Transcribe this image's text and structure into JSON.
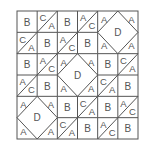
{
  "diagram": {
    "title": "",
    "grid": {
      "rows": 6,
      "cols": 6,
      "x0": 17,
      "y0": 11,
      "x1": 138,
      "y1": 139
    },
    "line_color": "#555555",
    "background": "#ffffff",
    "cells": [
      [
        "B",
        "C/A",
        "B",
        "A/C",
        "D",
        "D"
      ],
      [
        "C/A",
        "B",
        "A/C",
        "B",
        "D",
        "D"
      ],
      [
        "B",
        "A/C",
        "D",
        "D",
        "B",
        "C/A"
      ],
      [
        "A/C",
        "B",
        "D",
        "D",
        "C/A",
        "B"
      ],
      [
        "D",
        "D",
        "B",
        "C/A",
        "B",
        "A/C"
      ],
      [
        "D",
        "D",
        "C/A",
        "B",
        "A/C",
        "B"
      ]
    ],
    "d_blocks": [
      {
        "row": 0,
        "col": 4,
        "center_label": "D",
        "corner_label": "A"
      },
      {
        "row": 2,
        "col": 2,
        "center_label": "D",
        "corner_label": "A"
      },
      {
        "row": 4,
        "col": 0,
        "center_label": "D",
        "corner_label": "A"
      }
    ],
    "legend_of_pieces": {
      "B": "square",
      "C/A": "square split by diagonal, C upper-left, A lower-right",
      "A/C": "square split by diagonal, A upper-left, C lower-right",
      "D": "diamond with A corner triangles spanning 2x2 cells"
    }
  }
}
